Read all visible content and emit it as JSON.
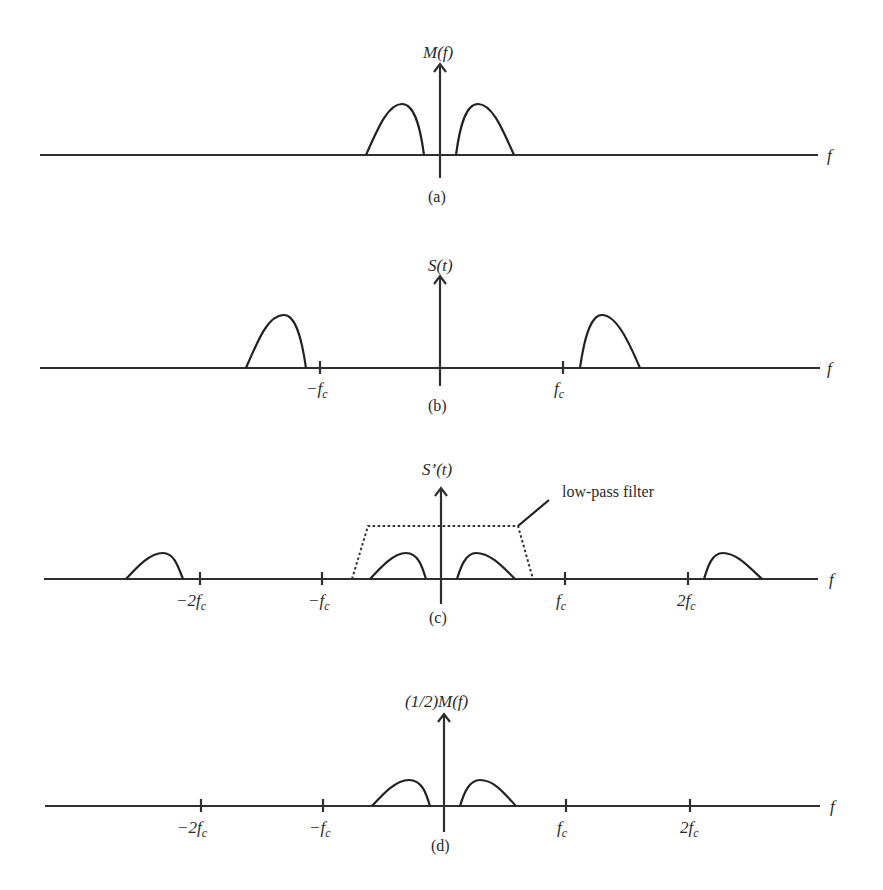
{
  "figure": {
    "panels": [
      {
        "id": "a",
        "caption": "(a)",
        "y_label": "M(f)",
        "x_label": "f",
        "ticks": []
      },
      {
        "id": "b",
        "caption": "(b)",
        "y_label": "S(t)",
        "x_label": "f",
        "ticks": [
          "−f",
          "f"
        ],
        "tick_sub": [
          "c",
          "c"
        ]
      },
      {
        "id": "c",
        "caption": "(c)",
        "y_label": "S’(t)",
        "x_label": "f",
        "ticks": [
          "−2f",
          "−f",
          "f",
          "2f"
        ],
        "tick_sub": [
          "c",
          "c",
          "c",
          "c"
        ],
        "annotation": "low-pass filter"
      },
      {
        "id": "d",
        "caption": "(d)",
        "y_label": "(1/2)M(f)",
        "x_label": "f",
        "ticks": [
          "−2f",
          "−f",
          "f",
          "2f"
        ],
        "tick_sub": [
          "c",
          "c",
          "c",
          "c"
        ]
      }
    ],
    "colors": {
      "ink": "#222222",
      "background": "#ffffff"
    }
  }
}
